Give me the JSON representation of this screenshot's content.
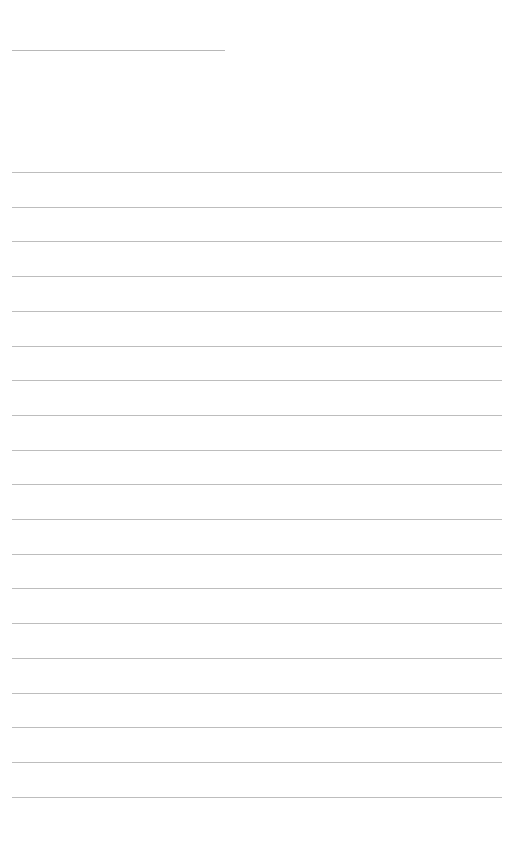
{
  "document": {
    "type": "blank lined paper",
    "header_line_count": 1,
    "ruled_line_count": 19
  }
}
